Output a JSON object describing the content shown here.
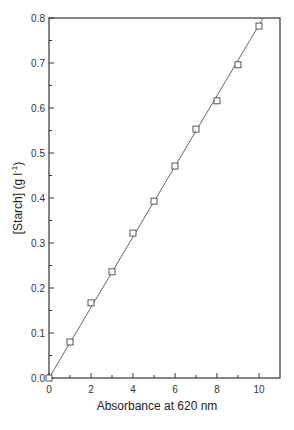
{
  "chart_data": {
    "type": "scatter",
    "title": "",
    "xlabel": "Absorbance at 620 nm",
    "ylabel": "[Starch] (g l",
    "ylabel_superscript": "-1",
    "ylabel_suffix": ")",
    "xlim": [
      0,
      11
    ],
    "ylim": [
      0,
      0.8
    ],
    "xticks": [
      0,
      2,
      4,
      6,
      8,
      10
    ],
    "xtick_labels": [
      "0",
      "2",
      "4",
      "6",
      "8",
      "10"
    ],
    "xminor_ticks": [
      1,
      3,
      5,
      7,
      9
    ],
    "yticks": [
      0.0,
      0.1,
      0.2,
      0.3,
      0.4,
      0.5,
      0.6,
      0.7,
      0.8
    ],
    "ytick_labels": [
      "0.0",
      "0.1",
      "0.2",
      "0.3",
      "0.4",
      "0.5",
      "0.6",
      "0.7",
      "0.8"
    ],
    "yminor_ticks": [
      0.05,
      0.15,
      0.25,
      0.35,
      0.45,
      0.55,
      0.65,
      0.75
    ],
    "grid": false,
    "legend": "none",
    "series": [
      {
        "name": "Data",
        "marker": "open-square",
        "x": [
          0,
          1,
          2,
          3,
          4,
          5,
          6,
          7,
          8,
          9,
          10
        ],
        "y": [
          0.0,
          0.08,
          0.167,
          0.236,
          0.322,
          0.393,
          0.471,
          0.553,
          0.616,
          0.696,
          0.782
        ]
      }
    ],
    "fit_line": {
      "name": "Linear fit",
      "x": [
        0,
        10.2
      ],
      "y": [
        0,
        0.8
      ]
    },
    "colors": {
      "axis": "#333333",
      "marker": "#444444",
      "line": "#555555"
    }
  }
}
